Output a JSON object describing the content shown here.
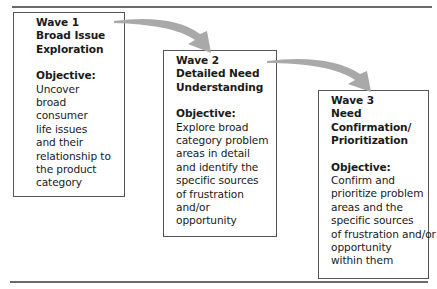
{
  "diagram": {
    "waves": [
      {
        "title_lines": [
          "Wave 1",
          "Broad Issue",
          "Exploration"
        ],
        "objective_label": "Objective:",
        "objective_lines": [
          "Uncover",
          "broad",
          "consumer",
          "life issues",
          "and their",
          "relationship to",
          "the product",
          "category"
        ]
      },
      {
        "title_lines": [
          "Wave 2",
          "Detailed Need",
          "Understanding"
        ],
        "objective_label": "Objective:",
        "objective_lines": [
          "Explore broad",
          "category problem",
          "areas in detail",
          "and identify the",
          "specific sources",
          "of frustration",
          "and/or",
          "opportunity"
        ]
      },
      {
        "title_lines": [
          "Wave 3",
          "Need",
          "Confirmation/",
          "Prioritization"
        ],
        "objective_label": "Objective:",
        "objective_lines": [
          "Confirm and",
          "prioritize problem",
          "areas and the",
          "specific sources",
          "of frustration and/or",
          "opportunity",
          "within them"
        ]
      }
    ],
    "arrow_color": "#a9a9a9"
  }
}
